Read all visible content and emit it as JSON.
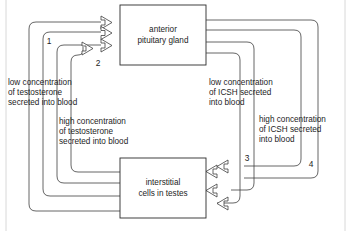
{
  "diagram": {
    "boxes": [
      {
        "id": "anterior-pituitary",
        "line1": "anterior",
        "line2": "pituitary gland"
      },
      {
        "id": "interstitial-cells",
        "line1": "interstitial",
        "line2": "cells in testes"
      }
    ],
    "labels": [
      {
        "id": "low-testosterone",
        "line1": "low concentration",
        "line2": "of testosterone",
        "line3": "secreted into blood"
      },
      {
        "id": "high-testosterone",
        "line1": "high concentration",
        "line2": "of testosterone",
        "line3": "secreted into blood"
      },
      {
        "id": "low-icsh",
        "line1": "low concentration",
        "line2": "of ICSH secreted",
        "line3": "into blood"
      },
      {
        "id": "high-icsh",
        "line1": "high concentration",
        "line2": "of ICSH secreted",
        "line3": "into blood"
      }
    ],
    "markers": [
      {
        "id": "marker-1",
        "text": "1"
      },
      {
        "id": "marker-2",
        "text": "2"
      },
      {
        "id": "marker-3",
        "text": "3"
      },
      {
        "id": "marker-4",
        "text": "4"
      }
    ],
    "colors": {
      "line": "#3f3f3f",
      "box_stroke": "#2b2b2b",
      "text": "#1d1d1d",
      "background": "#ffffff",
      "frame": "#d8d8d8"
    }
  }
}
